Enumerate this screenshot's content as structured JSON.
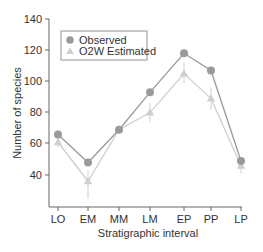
{
  "chart_data": {
    "type": "line",
    "title": "",
    "xlabel": "Stratigraphic interval",
    "ylabel": "Number of species",
    "categories": [
      "LO",
      "EM",
      "MM",
      "LM",
      "EP",
      "PP",
      "LP"
    ],
    "ylim": [
      25,
      140
    ],
    "yticks": [
      40,
      60,
      80,
      100,
      120,
      140
    ],
    "grid": false,
    "legend_position": "upper left",
    "series": [
      {
        "name": "Observed",
        "marker": "circle",
        "color": "#9a9a9a",
        "values": [
          66,
          48,
          69,
          93,
          118,
          107,
          49
        ]
      },
      {
        "name": "O2W Estimated",
        "marker": "triangle",
        "color": "#cfcfcf",
        "values": [
          61,
          36,
          69,
          80,
          105,
          89,
          46
        ],
        "error_low": [
          58,
          25,
          67,
          74,
          99,
          82,
          41
        ],
        "error_high": [
          64,
          43,
          71,
          86,
          112,
          96,
          51
        ]
      }
    ]
  },
  "legend": {
    "items": [
      {
        "label": "Observed"
      },
      {
        "label": "O2W Estimated"
      }
    ]
  },
  "axes": {
    "x_title": "Stratigraphic interval",
    "y_title": "Number of species",
    "y_tick_labels": [
      "140",
      "120",
      "100",
      "80",
      "60",
      "40"
    ],
    "x_tick_labels": [
      "LO",
      "EM",
      "MM",
      "LM",
      "EP",
      "PP",
      "LP"
    ]
  }
}
